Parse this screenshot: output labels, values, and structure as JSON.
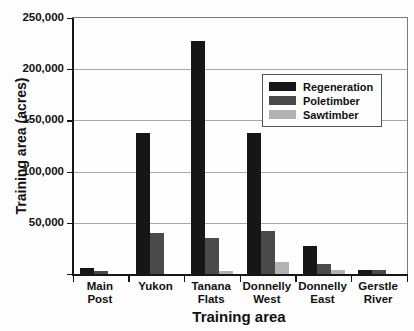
{
  "chart_data": {
    "type": "bar",
    "title": "",
    "xlabel": "Training area",
    "ylabel": "Training area (acres)",
    "ylim": [
      0,
      250000
    ],
    "ytick_step": 50000,
    "grid": true,
    "legend_position": "inside-right-middle",
    "yticks": [
      {
        "value": 250000,
        "label": "250,000"
      },
      {
        "value": 200000,
        "label": "200,000"
      },
      {
        "value": 150000,
        "label": "150,000"
      },
      {
        "value": 100000,
        "label": "100,000"
      },
      {
        "value": 50000,
        "label": "50,000"
      }
    ],
    "categories": [
      "Main Post",
      "Yukon",
      "Tanana Flats",
      "Donnelly West",
      "Donnelly East",
      "Gerstle River"
    ],
    "category_label_lines": [
      [
        "Main",
        "Post"
      ],
      [
        "Yukon"
      ],
      [
        "Tanana",
        "Flats"
      ],
      [
        "Donnelly",
        "West"
      ],
      [
        "Donnelly",
        "East"
      ],
      [
        "Gerstle",
        "River"
      ]
    ],
    "series": [
      {
        "name": "Regeneration",
        "color": "#161616",
        "values": [
          6500,
          138000,
          228000,
          138000,
          28000,
          5000
        ]
      },
      {
        "name": "Poletimber",
        "color": "#4a4a4a",
        "values": [
          3500,
          41000,
          36000,
          43000,
          11000,
          4500
        ]
      },
      {
        "name": "Sawtimber",
        "color": "#b2b2b2",
        "values": [
          0,
          0,
          4000,
          13000,
          4500,
          0
        ]
      }
    ],
    "colors": {
      "axis": "#161616",
      "gridline": "#a9a9a9",
      "background": "#fdfdfd"
    }
  }
}
